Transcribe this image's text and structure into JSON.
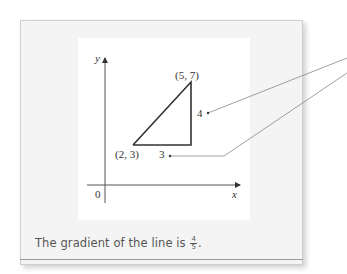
{
  "diagram": {
    "axes": {
      "x_label": "x",
      "y_label": "y",
      "origin_label": "0"
    },
    "points": [
      {
        "label": "(2, 3)",
        "x": 2,
        "y": 3
      },
      {
        "label": "(5, 7)",
        "x": 5,
        "y": 7
      }
    ],
    "triangle": {
      "rise_label": "4",
      "run_label": "3"
    },
    "colors": {
      "panel_bg": "#f4f4f4",
      "diagram_bg": "#ffffff",
      "line": "#333333",
      "leader": "#666666",
      "caption_text": "#555555"
    }
  },
  "caption": {
    "text": "The gradient of the line is",
    "fraction_numerator": "4",
    "fraction_denominator": "5",
    "suffix": "."
  }
}
